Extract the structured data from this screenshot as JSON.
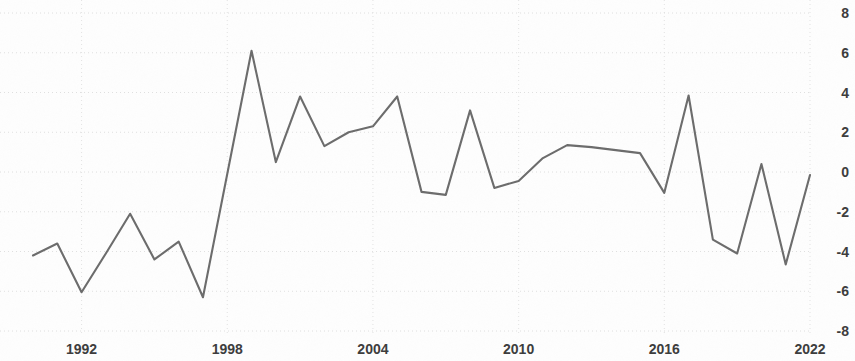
{
  "chart_data": {
    "type": "line",
    "title": "",
    "subtitle": "",
    "xlabel": "",
    "ylabel": "",
    "grid": true,
    "legend": null,
    "legend_position": "none",
    "line_color": "#6b6b6b",
    "text_color": "#3b3b3b",
    "background_color": "#fefefe",
    "xlim": [
      1990,
      2022
    ],
    "ylim": [
      -8,
      8
    ],
    "y_ticks": [
      8,
      6,
      4,
      2,
      0,
      -2,
      -4,
      -6,
      -8
    ],
    "y_tick_labels": [
      "8",
      "6",
      "4",
      "2",
      "0",
      "-2",
      "-4",
      "-6",
      "-8"
    ],
    "x_ticks": [
      1992,
      1998,
      2004,
      2010,
      2016,
      2022
    ],
    "x_tick_labels": [
      "1992",
      "1998",
      "2004",
      "2010",
      "2016",
      "2022"
    ],
    "x": [
      1990,
      1991,
      1992,
      1993,
      1994,
      1995,
      1996,
      1997,
      1998,
      1999,
      2000,
      2001,
      2002,
      2003,
      2004,
      2005,
      2006,
      2007,
      2008,
      2009,
      2010,
      2011,
      2012,
      2013,
      2014,
      2015,
      2016,
      2017,
      2018,
      2019,
      2020,
      2021,
      2022
    ],
    "values": [
      -4.2,
      -3.6,
      -6.05,
      -4.1,
      -2.1,
      -4.4,
      -3.5,
      -6.3,
      -0.1,
      6.1,
      0.5,
      3.8,
      1.3,
      2.0,
      2.3,
      3.8,
      -1.0,
      -1.15,
      3.1,
      -0.8,
      -0.45,
      0.7,
      1.35,
      1.25,
      1.1,
      0.95,
      -1.05,
      3.85,
      -3.4,
      -4.1,
      0.4,
      -4.65,
      -0.15
    ],
    "series": [
      {
        "name": "series-1",
        "color": "#6b6b6b",
        "values": [
          -4.2,
          -3.6,
          -6.05,
          -4.1,
          -2.1,
          -4.4,
          -3.5,
          -6.3,
          -0.1,
          6.1,
          0.5,
          3.8,
          1.3,
          2.0,
          2.3,
          3.8,
          -1.0,
          -1.15,
          3.1,
          -0.8,
          -0.45,
          0.7,
          1.35,
          1.25,
          1.1,
          0.95,
          -1.05,
          3.85,
          -3.4,
          -4.1,
          0.4,
          -4.65,
          -0.15
        ]
      }
    ]
  }
}
